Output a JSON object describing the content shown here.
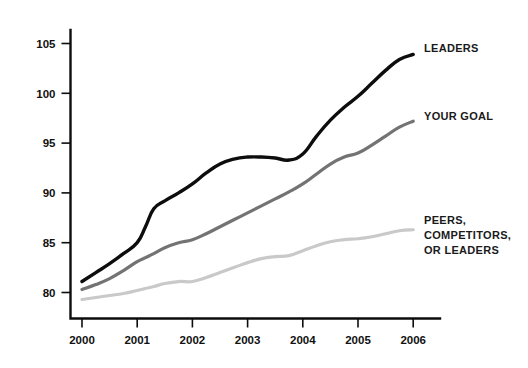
{
  "chart_data": {
    "type": "line",
    "title": "",
    "subtitle": "",
    "xlabel": "",
    "ylabel": "",
    "xlim": [
      2000,
      2006
    ],
    "ylim": [
      80,
      105
    ],
    "grid": false,
    "legend_position": "right-inline",
    "x_ticks": [
      "2000",
      "2001",
      "2002",
      "2003",
      "2004",
      "2005",
      "2006"
    ],
    "y_ticks": [
      "80",
      "85",
      "90",
      "95",
      "100",
      "105"
    ],
    "x": [
      2000,
      2000.25,
      2000.5,
      2000.75,
      2001,
      2001.15,
      2001.3,
      2001.5,
      2001.75,
      2002,
      2002.25,
      2002.5,
      2002.75,
      2003,
      2003.25,
      2003.5,
      2003.75,
      2004,
      2004.25,
      2004.5,
      2004.75,
      2005,
      2005.25,
      2005.5,
      2005.75,
      2006
    ],
    "series": [
      {
        "name": "LEADERS",
        "color": "#0d0d0d",
        "width": 3.4,
        "label_lines": [
          "LEADERS"
        ],
        "label_x": 424,
        "label_y": 52,
        "values": [
          81.1,
          82.0,
          82.9,
          83.9,
          85.0,
          86.6,
          88.4,
          89.2,
          90.0,
          90.9,
          92.0,
          92.9,
          93.4,
          93.6,
          93.6,
          93.5,
          93.3,
          93.9,
          95.7,
          97.3,
          98.6,
          99.7,
          101.0,
          102.3,
          103.4,
          103.9
        ]
      },
      {
        "name": "YOUR GOAL",
        "color": "#737373",
        "width": 3.2,
        "label_lines": [
          "YOUR GOAL"
        ],
        "label_x": 424,
        "label_y": 120,
        "values": [
          80.3,
          80.8,
          81.4,
          82.2,
          83.1,
          83.5,
          83.9,
          84.5,
          85.0,
          85.3,
          85.9,
          86.6,
          87.3,
          88.0,
          88.7,
          89.4,
          90.1,
          90.9,
          91.9,
          92.9,
          93.6,
          94.0,
          94.8,
          95.7,
          96.6,
          97.2
        ]
      },
      {
        "name": "PEERS, COMPETITORS, OR LEADERS",
        "color": "#c9c9c9",
        "width": 3.2,
        "label_lines": [
          "PEERS,",
          "COMPETITORS,",
          "OR LEADERS"
        ],
        "label_x": 424,
        "label_y": 224,
        "values": [
          79.3,
          79.5,
          79.7,
          79.9,
          80.2,
          80.4,
          80.6,
          80.9,
          81.1,
          81.1,
          81.5,
          82.0,
          82.5,
          83.0,
          83.4,
          83.6,
          83.7,
          84.2,
          84.7,
          85.1,
          85.3,
          85.4,
          85.6,
          85.9,
          86.2,
          86.3
        ]
      }
    ]
  }
}
